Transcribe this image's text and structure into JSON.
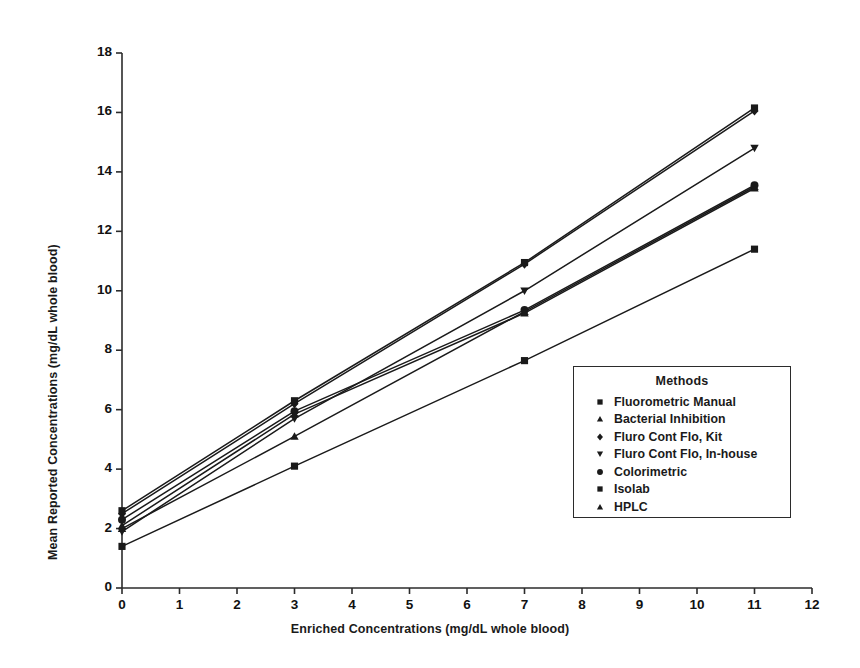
{
  "chart_data": {
    "type": "line",
    "title": "",
    "xlabel": "Enriched Concentrations (mg/dL whole blood)",
    "ylabel": "Mean Reported Concentrations (mg/dL whole blood)",
    "xlim": [
      0,
      12
    ],
    "ylim": [
      0,
      18
    ],
    "xticks": [
      "0",
      "1",
      "2",
      "3",
      "4",
      "5",
      "6",
      "7",
      "8",
      "9",
      "10",
      "11",
      "12"
    ],
    "yticks": [
      "0",
      "2",
      "4",
      "6",
      "8",
      "10",
      "12",
      "14",
      "16",
      "18"
    ],
    "grid": false,
    "legend_position": "inside-right",
    "legend_title": "Methods",
    "x": [
      0,
      3,
      7,
      11
    ],
    "series": [
      {
        "name": "Fluorometric Manual",
        "marker": "square",
        "values": [
          1.4,
          4.1,
          7.65,
          11.4
        ]
      },
      {
        "name": "Bacterial Inhibition",
        "marker": "triangle-up",
        "values": [
          2.0,
          5.1,
          9.3,
          13.5
        ]
      },
      {
        "name": "Fluro Cont Flo, Kit",
        "marker": "diamond",
        "values": [
          2.5,
          6.2,
          10.9,
          16.05
        ]
      },
      {
        "name": "Fluro Cont Flo, In-house",
        "marker": "triangle-down",
        "values": [
          1.9,
          5.7,
          10.0,
          14.8
        ]
      },
      {
        "name": "Colorimetric",
        "marker": "circle",
        "values": [
          2.3,
          5.95,
          9.35,
          13.55
        ]
      },
      {
        "name": "Isolab",
        "marker": "square",
        "values": [
          2.6,
          6.3,
          10.95,
          16.15
        ]
      },
      {
        "name": "HPLC",
        "marker": "triangle-up",
        "values": [
          2.1,
          5.85,
          9.25,
          13.45
        ]
      }
    ]
  },
  "axis": {
    "x_title": "Enriched Concentrations (mg/dL whole blood)",
    "y_title": "Mean Reported Concentrations (mg/dL whole blood)"
  },
  "legend": {
    "title": "Methods",
    "items": [
      {
        "label": "Fluorometric Manual",
        "marker": "square"
      },
      {
        "label": "Bacterial Inhibition",
        "marker": "triangle-up"
      },
      {
        "label": "Fluro Cont Flo, Kit",
        "marker": "diamond"
      },
      {
        "label": "Fluro Cont Flo, In-house",
        "marker": "triangle-down"
      },
      {
        "label": "Colorimetric",
        "marker": "circle"
      },
      {
        "label": "Isolab",
        "marker": "square"
      },
      {
        "label": "HPLC",
        "marker": "triangle-up"
      }
    ]
  },
  "style": {
    "line_color": "#1a1a1a",
    "axis_color": "#2b2b2b",
    "background": "#ffffff"
  }
}
